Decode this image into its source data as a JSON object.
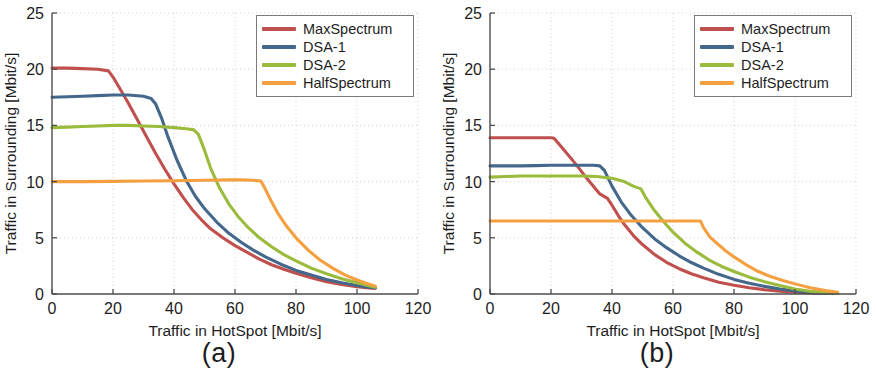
{
  "figure": {
    "background": "#ffffff",
    "panels": [
      {
        "id": "a",
        "caption": "(a)"
      },
      {
        "id": "b",
        "caption": "(b)"
      }
    ]
  },
  "colors": {
    "MaxSpectrum": "#c0504d",
    "DSA-1": "#44688c",
    "DSA-2": "#9bbb3c",
    "HalfSpectrum": "#f5a040",
    "axis": "#4d4d4d",
    "grid": "#c8c8c8",
    "text": "#1d1d1d",
    "legend_border": "#7a7a7a"
  },
  "chart_data": [
    {
      "type": "line",
      "panel": "a",
      "title": "",
      "caption": "(a)",
      "xlabel": "Traffic in HotSpot [Mbit/s]",
      "ylabel": "Traffic in Surrounding [Mbit/s]",
      "xlim": [
        0,
        120
      ],
      "ylim": [
        0,
        25
      ],
      "xticks": [
        0,
        20,
        40,
        60,
        80,
        100,
        120
      ],
      "yticks": [
        0,
        5,
        10,
        15,
        20,
        25
      ],
      "xticklabels": [
        "0",
        "20",
        "40",
        "60",
        "80",
        "100",
        "120"
      ],
      "yticklabels": [
        "0",
        "5",
        "10",
        "15",
        "20",
        "25"
      ],
      "grid": true,
      "grid_style": "dotted",
      "legend_position": "upper right",
      "series": [
        {
          "name": "MaxSpectrum",
          "color": "#c0504d",
          "x": [
            0,
            5,
            10,
            15,
            18.5,
            20,
            22,
            25,
            28,
            31,
            34,
            37,
            40,
            43,
            46,
            49,
            52,
            56,
            60,
            64,
            68,
            72,
            76,
            80,
            85,
            90,
            95,
            100,
            103,
            106
          ],
          "y": [
            20.1,
            20.1,
            20.05,
            20.0,
            19.85,
            19.3,
            18.4,
            17.0,
            15.5,
            14.0,
            12.5,
            11.1,
            9.8,
            8.6,
            7.5,
            6.6,
            5.8,
            5.0,
            4.3,
            3.7,
            3.1,
            2.6,
            2.2,
            1.85,
            1.45,
            1.1,
            0.85,
            0.65,
            0.55,
            0.5
          ]
        },
        {
          "name": "DSA-1",
          "color": "#44688c",
          "x": [
            0,
            5,
            10,
            15,
            20,
            25,
            30,
            32.5,
            34,
            36,
            38,
            41,
            44,
            47,
            50,
            54,
            58,
            62,
            66,
            70,
            75,
            80,
            85,
            90,
            95,
            100,
            103,
            106
          ],
          "y": [
            17.5,
            17.55,
            17.6,
            17.65,
            17.7,
            17.7,
            17.6,
            17.4,
            16.9,
            15.6,
            14.0,
            11.9,
            10.1,
            8.7,
            7.6,
            6.4,
            5.4,
            4.6,
            3.9,
            3.3,
            2.65,
            2.1,
            1.7,
            1.3,
            1.0,
            0.75,
            0.62,
            0.55
          ]
        },
        {
          "name": "DSA-2",
          "color": "#9bbb3c",
          "x": [
            0,
            5,
            10,
            15,
            20,
            25,
            30,
            35,
            40,
            44,
            46.5,
            48,
            50,
            52,
            55,
            58,
            61,
            64,
            68,
            72,
            76,
            80,
            85,
            90,
            95,
            100,
            103,
            106
          ],
          "y": [
            14.8,
            14.85,
            14.9,
            14.95,
            15.0,
            15.0,
            14.95,
            14.9,
            14.8,
            14.7,
            14.6,
            14.2,
            12.8,
            11.2,
            9.4,
            8.0,
            6.9,
            6.0,
            5.0,
            4.2,
            3.5,
            2.95,
            2.3,
            1.8,
            1.35,
            1.0,
            0.8,
            0.6
          ]
        },
        {
          "name": "HalfSpectrum",
          "color": "#f5a040",
          "x": [
            0,
            10,
            20,
            30,
            40,
            50,
            58,
            62,
            66,
            68.5,
            70,
            72,
            74,
            77,
            80,
            84,
            88,
            92,
            96,
            100,
            103,
            106
          ],
          "y": [
            10.0,
            10.0,
            10.02,
            10.05,
            10.08,
            10.12,
            10.15,
            10.15,
            10.12,
            10.05,
            9.3,
            8.2,
            7.2,
            6.0,
            5.0,
            3.9,
            3.0,
            2.3,
            1.7,
            1.25,
            0.95,
            0.7
          ]
        }
      ]
    },
    {
      "type": "line",
      "panel": "b",
      "title": "",
      "caption": "(b)",
      "xlabel": "Traffic in HotSpot [Mbit/s]",
      "ylabel": "Traffic in Surrounding [Mbit/s]",
      "xlim": [
        0,
        120
      ],
      "ylim": [
        0,
        25
      ],
      "xticks": [
        0,
        20,
        40,
        60,
        80,
        100,
        120
      ],
      "yticks": [
        0,
        5,
        10,
        15,
        20,
        25
      ],
      "xticklabels": [
        "0",
        "20",
        "40",
        "60",
        "80",
        "100",
        "120"
      ],
      "yticklabels": [
        "0",
        "5",
        "10",
        "15",
        "20",
        "25"
      ],
      "grid": true,
      "grid_style": "dotted",
      "legend_position": "upper right",
      "series": [
        {
          "name": "MaxSpectrum",
          "color": "#c0504d",
          "x": [
            0,
            5,
            10,
            15,
            20,
            21,
            24,
            28,
            32,
            36,
            38.5,
            40,
            42,
            44,
            47,
            50,
            54,
            58,
            62,
            66,
            70,
            75,
            80,
            85,
            90,
            95,
            100,
            105,
            110,
            114
          ],
          "y": [
            13.9,
            13.9,
            13.9,
            13.9,
            13.9,
            13.85,
            12.9,
            11.6,
            10.2,
            8.9,
            8.5,
            7.9,
            7.0,
            6.2,
            5.2,
            4.4,
            3.5,
            2.8,
            2.25,
            1.8,
            1.45,
            1.05,
            0.78,
            0.55,
            0.38,
            0.25,
            0.15,
            0.1,
            0.07,
            0.05
          ]
        },
        {
          "name": "DSA-1",
          "color": "#44688c",
          "x": [
            0,
            5,
            10,
            15,
            20,
            25,
            30,
            34,
            36,
            37.5,
            40,
            43,
            46,
            50,
            54,
            58,
            62,
            66,
            70,
            75,
            80,
            85,
            90,
            95,
            100,
            105,
            110,
            114
          ],
          "y": [
            11.4,
            11.4,
            11.4,
            11.42,
            11.45,
            11.45,
            11.45,
            11.45,
            11.4,
            11.0,
            9.6,
            8.2,
            7.1,
            5.9,
            4.9,
            4.1,
            3.4,
            2.8,
            2.3,
            1.75,
            1.3,
            0.95,
            0.68,
            0.45,
            0.28,
            0.16,
            0.09,
            0.05
          ]
        },
        {
          "name": "DSA-2",
          "color": "#9bbb3c",
          "x": [
            0,
            5,
            10,
            15,
            20,
            25,
            30,
            35,
            40,
            44,
            47,
            49.5,
            51,
            54,
            57,
            60,
            64,
            68,
            72,
            76,
            80,
            85,
            90,
            95,
            100,
            105,
            110,
            114
          ],
          "y": [
            10.4,
            10.45,
            10.5,
            10.5,
            10.5,
            10.5,
            10.5,
            10.45,
            10.3,
            10.0,
            9.6,
            9.35,
            8.6,
            7.4,
            6.4,
            5.5,
            4.5,
            3.7,
            3.0,
            2.45,
            2.0,
            1.5,
            1.1,
            0.75,
            0.45,
            0.25,
            0.12,
            0.06
          ]
        },
        {
          "name": "HalfSpectrum",
          "color": "#f5a040",
          "x": [
            0,
            10,
            20,
            30,
            40,
            50,
            60,
            66,
            69,
            70,
            72,
            74,
            77,
            80,
            84,
            88,
            92,
            96,
            100,
            105,
            110,
            114
          ],
          "y": [
            6.5,
            6.5,
            6.5,
            6.5,
            6.5,
            6.5,
            6.5,
            6.5,
            6.5,
            5.9,
            5.1,
            4.6,
            3.9,
            3.3,
            2.6,
            2.0,
            1.55,
            1.2,
            0.9,
            0.55,
            0.3,
            0.15
          ]
        }
      ]
    }
  ],
  "legend": {
    "entries": [
      {
        "label": "MaxSpectrum",
        "color": "#c0504d"
      },
      {
        "label": "DSA-1",
        "color": "#44688c"
      },
      {
        "label": "DSA-2",
        "color": "#9bbb3c"
      },
      {
        "label": "HalfSpectrum",
        "color": "#f5a040"
      }
    ]
  }
}
